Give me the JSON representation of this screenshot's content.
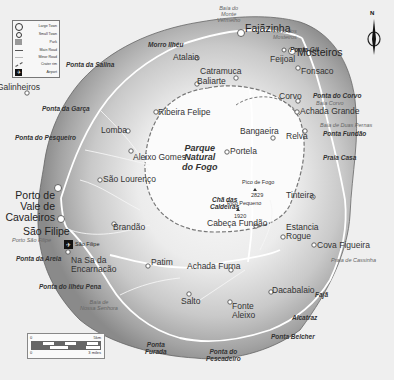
{
  "map": {
    "title": "Fogo",
    "legend": {
      "items": [
        {
          "icon": "large-town-circle-icon",
          "label": "Large Town"
        },
        {
          "icon": "small-town-circle-icon",
          "label": "Small Town"
        },
        {
          "icon": "park-square-icon",
          "label": "Park"
        },
        {
          "icon": "main-road-line-icon",
          "label": "Main Road"
        },
        {
          "icon": "minor-road-line-icon",
          "label": "Minor Road"
        },
        {
          "icon": "crater-rim-line-icon",
          "label": "Crater rim"
        },
        {
          "icon": "airport-plane-icon",
          "label": "Airport"
        }
      ]
    },
    "compass": {
      "label": "N"
    },
    "scale": {
      "km_start": "0",
      "km_end": "5km",
      "mi_start": "0",
      "mi_end": "3 miles"
    },
    "park": {
      "line1": "Parque",
      "line2": "Natural",
      "line3": "do Fogo"
    },
    "peaks": [
      {
        "name": "Pico de Fogo",
        "elevation": "2829"
      },
      {
        "name": "Pico Pequeno",
        "elevation": "1920"
      }
    ],
    "large_towns": [
      {
        "name": "Fajãzinha"
      },
      {
        "name": "Mosteiros"
      },
      {
        "name": "Porto de Vale de Cavaleiros",
        "line1": "Porto de",
        "line2": "Vale de",
        "line3": "Cavaleiros"
      },
      {
        "name": "São Filipe"
      }
    ],
    "small_towns": [
      {
        "name": "Atalaia"
      },
      {
        "name": "Feijoal"
      },
      {
        "name": "Catramuca"
      },
      {
        "name": "Baliarte"
      },
      {
        "name": "Galinheiros"
      },
      {
        "name": "Ribeira Felipe"
      },
      {
        "name": "Fonsaco"
      },
      {
        "name": "Corvo"
      },
      {
        "name": "Achada Grande"
      },
      {
        "name": "Relva"
      },
      {
        "name": "Bangaeira"
      },
      {
        "name": "Portela"
      },
      {
        "name": "Lomba"
      },
      {
        "name": "Aleixo Gomes"
      },
      {
        "name": "São Lourenço"
      },
      {
        "name": "Tinteira"
      },
      {
        "name": "Estancia Rogue",
        "line1": "Estancia",
        "line2": "Rogue"
      },
      {
        "name": "Cabeça Fundão"
      },
      {
        "name": "Cova Figueira"
      },
      {
        "name": "Brandão"
      },
      {
        "name": "Na Sa da Encarnacão",
        "line1": "Na Sa da",
        "line2": "Encarnacão"
      },
      {
        "name": "Patim"
      },
      {
        "name": "Achada Furna"
      },
      {
        "name": "Salto"
      },
      {
        "name": "Fonte Aleixo",
        "line1": "Fonte",
        "line2": "Aleixo"
      },
      {
        "name": "Dacabalaio"
      }
    ],
    "chã_das_caldeiras": {
      "line1": "Chã das",
      "line2": "Caldeiras"
    },
    "airport": {
      "name": "São Filipe"
    },
    "capes": [
      {
        "name": "Morro Ilhéu"
      },
      {
        "name": "Ponta da Salina"
      },
      {
        "name": "Ponta Gil"
      },
      {
        "name": "Ponta do Corvo"
      },
      {
        "name": "Ponta Fundão"
      },
      {
        "name": "Praia Casa"
      },
      {
        "name": "Ponta da Garça"
      },
      {
        "name": "Ponta do Pesqueiro"
      },
      {
        "name": "Ponta da Areia"
      },
      {
        "name": "Ponta do Ilhéu Pena"
      },
      {
        "name": "Fajã"
      },
      {
        "name": "Alcatraz"
      },
      {
        "name": "Ponta Belcher"
      },
      {
        "name": "Ponta Furada",
        "line1": "Ponta",
        "line2": "Furada"
      },
      {
        "name": "Ponta do Pescadeiro",
        "line1": "Ponta do",
        "line2": "Pescadeiro"
      }
    ],
    "bays": [
      {
        "name": "Baía do Monte Vermelho",
        "line1": "Baía do",
        "line2": "Monte",
        "line3": "Vermelho"
      },
      {
        "name": "Porto dos Mosteiros",
        "line1": "Porto dos",
        "line2": "Mosteiros"
      },
      {
        "name": "Baía Corvo"
      },
      {
        "name": "Baía de Duas Pernas"
      },
      {
        "name": "Porto São Filipe"
      },
      {
        "name": "Praia de Cassinha"
      },
      {
        "name": "Baía de Nossa Senhora",
        "line1": "Baía de",
        "line2": "Nossa Senhora"
      }
    ],
    "colors": {
      "sea": "#efefef",
      "coast_dark": "#8a8a8a",
      "slope_mid": "#b8b8b8",
      "plateau_light": "#e4e4e4",
      "park_white": "#fbfbfb",
      "road": "#ffffff",
      "crater_rim": "#777777"
    }
  }
}
